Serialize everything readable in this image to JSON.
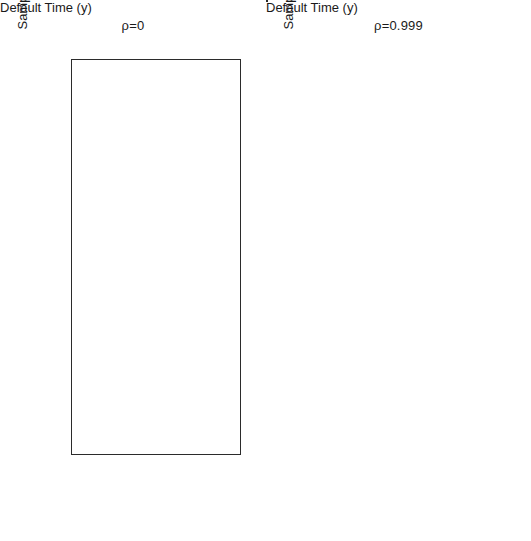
{
  "figure": {
    "width": 531,
    "height": 541,
    "background": "#ffffff",
    "colors": {
      "dark_series": "#111111",
      "light_series": "#d9d9d9",
      "axis": "#2b2b2b",
      "text": "#1a1a1a"
    }
  },
  "chart_data": [
    {
      "type": "scatter",
      "title": "ρ=0",
      "xlabel": "Default Time (y)",
      "ylabel": "Sample",
      "xscale": "log",
      "xlim": [
        0.055,
        900
      ],
      "ylim": [
        -3,
        104
      ],
      "grid": false,
      "legend": "none",
      "xticks": [
        0.1,
        0.5,
        1,
        5,
        10,
        50,
        100,
        500
      ],
      "xticklabels": [
        "0.1",
        "0.5",
        "",
        "5.0",
        "",
        "50.0",
        "",
        "500.0"
      ],
      "yticks": [
        0,
        20,
        40,
        60,
        80,
        100
      ],
      "yticklabels": [
        "0",
        "20",
        "40",
        "60",
        "80",
        "100"
      ],
      "series": [
        {
          "name": "dark",
          "color": "#111111",
          "x": [
            0.72,
            1.95,
            2.2,
            3.4,
            1.2,
            1.35,
            2.6,
            0.52,
            1.7,
            2.0,
            2.05,
            2.6,
            3.0,
            1.6,
            1.85,
            3.1,
            0.3,
            0.34,
            1.75,
            2.9,
            1.9,
            2.35,
            2.4,
            2.5,
            1.95,
            2.15,
            2.9,
            0.9,
            1.8,
            2.35,
            2.45,
            2.05,
            0.13,
            0.45,
            0.6,
            1.6,
            2.3,
            0.5,
            0.38,
            1.15,
            0.42,
            2.55,
            0.55,
            1.5,
            1.9,
            2.2,
            2.6,
            0.38,
            0.95,
            1.65,
            2.3,
            1.1,
            1.7,
            1.95,
            2.0,
            1.85,
            1.6,
            1.8,
            0.85,
            1.95,
            2.1,
            2.6,
            0.75,
            1.4,
            1.8,
            2.05,
            1.2,
            1.9,
            2.0,
            0.46,
            0.62,
            1.05,
            1.6,
            0.95,
            1.25,
            0.5,
            1.05,
            1.3,
            1.45,
            1.0,
            1.9,
            2.1,
            0.9,
            1.5,
            2.1,
            2.3,
            0.58,
            1.05,
            1.3,
            1.45,
            1.6,
            0.7,
            0.85,
            1.4,
            1.7,
            0.16,
            0.65,
            0.8,
            0.86,
            1.0,
            1.25,
            1.75,
            1.9
          ],
          "y": [
            100,
            99.5,
            96.5,
            96.5,
            95.5,
            95,
            94,
            91.5,
            92,
            91.5,
            90.5,
            89.5,
            88,
            87,
            86,
            85.5,
            85,
            84,
            83.5,
            83,
            82,
            81.5,
            81,
            80.5,
            80,
            79.5,
            79,
            78.5,
            78,
            77.5,
            77,
            75,
            74,
            72,
            71.5,
            71,
            70.5,
            68.5,
            67,
            66,
            65,
            64.5,
            62.5,
            61.5,
            61,
            60.5,
            60,
            59.5,
            58.5,
            58,
            57.5,
            56,
            55.5,
            55,
            54.5,
            52.5,
            51.5,
            50.5,
            50,
            49.5,
            49,
            48.5,
            47,
            46.5,
            46,
            45.5,
            44,
            43.5,
            43,
            41,
            40.5,
            40,
            39.5,
            37,
            36.5,
            33.5,
            32,
            31,
            30,
            28.5,
            28,
            27.5,
            25.5,
            25,
            24.5,
            24,
            22.5,
            22,
            21.5,
            20,
            19,
            17.5,
            16.5,
            15,
            14.5,
            12,
            10.5,
            9.5,
            8.5,
            7,
            6,
            5,
            3.5,
            3
          ]
        },
        {
          "name": "light",
          "color": "#d9d9d9",
          "x": [
            18,
            42,
            75,
            150,
            28,
            60,
            110,
            210,
            15,
            35,
            68,
            130,
            24,
            52,
            95,
            180,
            20,
            44,
            80,
            160,
            30,
            62,
            115,
            230,
            16,
            38,
            72,
            140,
            26,
            55,
            100,
            195,
            22,
            48,
            88,
            170,
            33,
            65,
            120,
            250,
            17,
            40,
            76,
            145,
            29,
            58,
            105,
            205,
            19,
            43,
            82,
            155,
            25,
            53,
            98,
            185,
            21,
            46,
            86,
            165,
            31,
            63,
            118,
            240,
            14,
            36,
            70,
            135,
            27,
            56,
            102,
            200,
            23,
            50,
            90,
            175,
            34,
            66,
            125,
            260,
            18,
            41,
            78,
            148,
            28,
            59,
            108,
            215,
            15,
            37,
            73,
            138,
            32,
            64,
            122,
            245,
            20,
            45,
            84,
            158,
            26,
            54,
            99,
            190,
            22,
            49,
            92,
            172
          ]
        }
      ]
    },
    {
      "type": "scatter",
      "title": "ρ=0.999",
      "xlabel": "Default Time (y)",
      "ylabel": "Sample",
      "xscale": "log",
      "xlim": [
        0.055,
        900
      ],
      "ylim": [
        -3,
        104
      ],
      "grid": false,
      "legend": "none",
      "xticks": [
        0.1,
        0.5,
        1,
        5,
        10,
        50,
        100,
        500
      ],
      "xticklabels": [
        "0.1",
        "0.5",
        "",
        "5.0",
        "",
        "50.0",
        "",
        "500.0"
      ],
      "yticks": [
        0,
        20,
        40,
        60,
        80,
        100
      ],
      "yticklabels": [
        "0",
        "20",
        "40",
        "60",
        "80",
        "100"
      ],
      "series": [
        {
          "name": "dark",
          "color": "#111111",
          "x": [
            3.1,
            3.4,
            3.0,
            2.0,
            2.1,
            3.2,
            3.4,
            1.2,
            1.3,
            0.78,
            2.7,
            2.9,
            3.0,
            3.1,
            2.6,
            2.75,
            2.9,
            3.0,
            2.0,
            2.1,
            3.0,
            1.95,
            2.05,
            3.0,
            3.1,
            2.1,
            2.2,
            1.1,
            1.2,
            2.9,
            3.0,
            2.7,
            2.85,
            2.95,
            3.0,
            2.6,
            2.7,
            2.0,
            2.1,
            2.2,
            1.1,
            1.2,
            2.0,
            3.4
          ],
          "y": [
            99.5,
            99.5,
            96,
            92.5,
            92.5,
            85.5,
            85.5,
            84,
            83,
            78,
            74.5,
            74.5,
            72.5,
            72,
            70,
            69.5,
            69.5,
            69,
            65.5,
            65.5,
            58,
            54.5,
            54.5,
            45.5,
            45.5,
            41.5,
            41.5,
            38,
            38,
            35.5,
            35.5,
            33,
            33,
            32.5,
            32.5,
            28,
            28,
            20.5,
            20.5,
            20.5,
            12,
            12,
            11.5,
            5.5
          ]
        },
        {
          "name": "light",
          "color": "#d9d9d9",
          "x": [
            12,
            30,
            55,
            110,
            20,
            45,
            85,
            170,
            9,
            25,
            48,
            95,
            16,
            38,
            70,
            140,
            11,
            28,
            52,
            105,
            22,
            50,
            92,
            185,
            14,
            33,
            62,
            125,
            18,
            42,
            78,
            155,
            10,
            26,
            50,
            100,
            24,
            58,
            108,
            210,
            13,
            31,
            58,
            118,
            19,
            44,
            82,
            165,
            8,
            23,
            46,
            90,
            17,
            40,
            75,
            150,
            15,
            35,
            66,
            132,
            21,
            48,
            88,
            175,
            12,
            29,
            54,
            112,
            25,
            60,
            115,
            230,
            9,
            27,
            51,
            102,
            20,
            47,
            86,
            168,
            16,
            37,
            69,
            138,
            11,
            32,
            64,
            128,
            23,
            53,
            98,
            195,
            14,
            34,
            72,
            145,
            18,
            41,
            80,
            160,
            10,
            30,
            56,
            114
          ]
        }
      ]
    }
  ]
}
